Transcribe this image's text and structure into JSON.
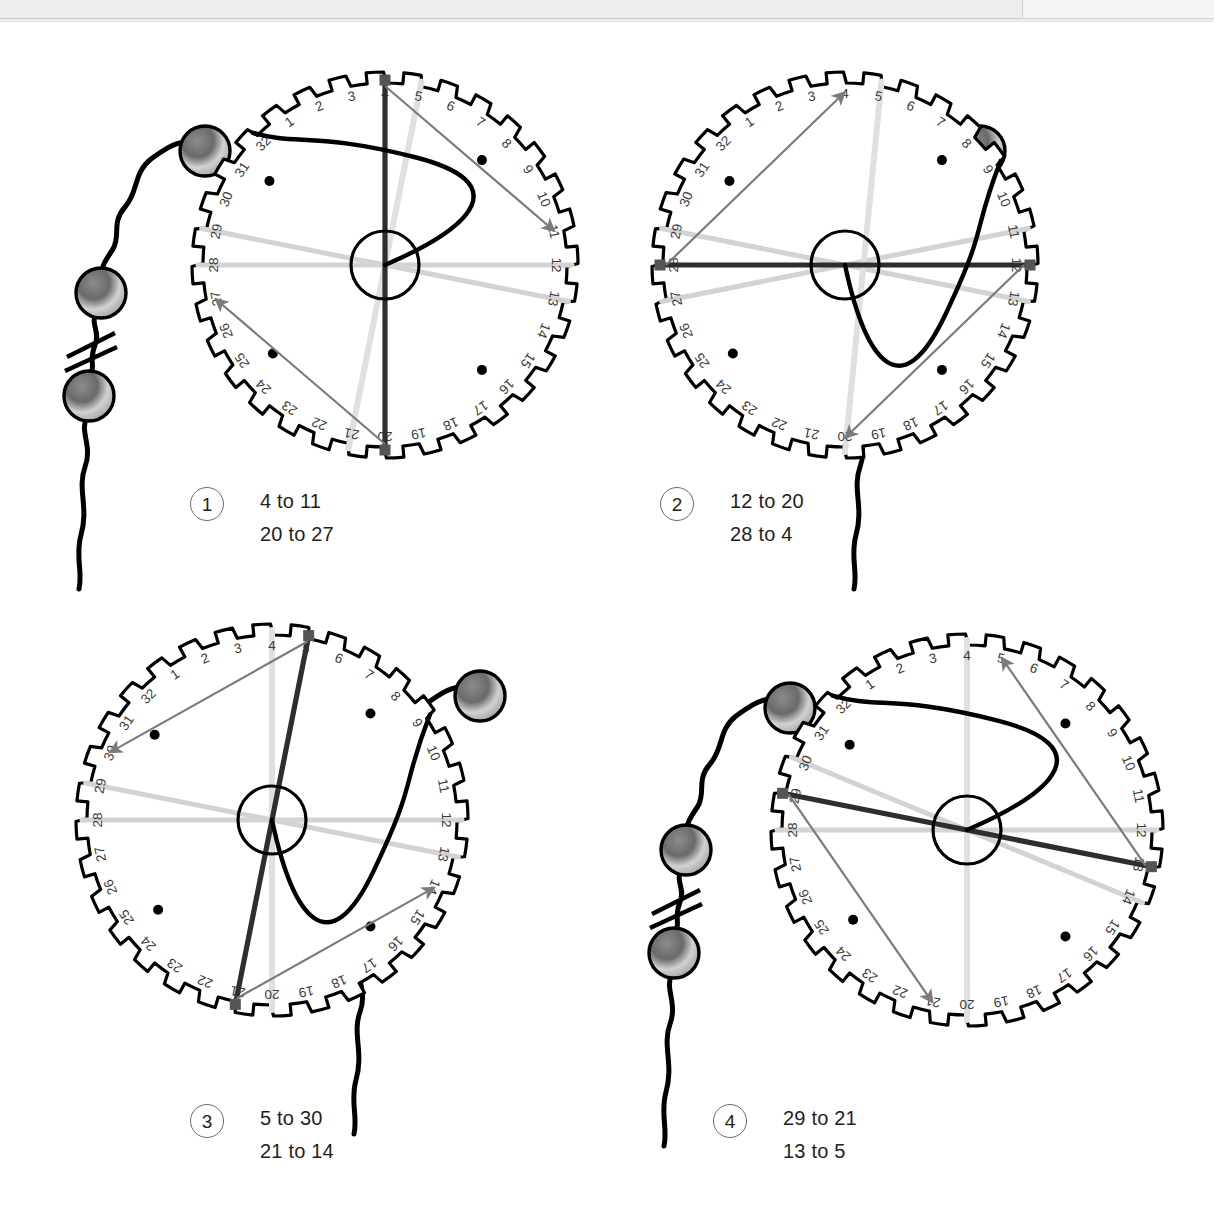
{
  "page": {
    "background": "#ffffff",
    "scan_band_color": "#ededee",
    "width": 1213,
    "height": 1221
  },
  "dial": {
    "tick_count": 32,
    "labels": [
      "1",
      "2",
      "3",
      "4",
      "5",
      "6",
      "7",
      "8",
      "9",
      "10",
      "11",
      "12",
      "13",
      "14",
      "15",
      "16",
      "17",
      "18",
      "19",
      "20",
      "21",
      "22",
      "23",
      "24",
      "25",
      "26",
      "27",
      "28",
      "29",
      "30",
      "31",
      "32"
    ],
    "hub_label": "",
    "inner_dots": 4,
    "colors": {
      "outline": "#000000",
      "label": "#3a3a3a",
      "dark_cord": "#2e2e2e",
      "arrow_gray": "#7b7b7b",
      "faint_gray": "#d3d3d3",
      "mid_gray": "#bdbdbd",
      "bead_dark": "#4a4a4a",
      "bead_light": "#c8c8c8",
      "marker": "#555555"
    }
  },
  "figures": [
    {
      "id": "figure-1",
      "number": "1",
      "lines": [
        "4 to 11",
        "20 to 27"
      ],
      "chain_side": "left",
      "cord_entry": 32,
      "cord_exit": 12,
      "dark_chord": {
        "from": 4,
        "to": 20
      },
      "pale_chord": {
        "from": 5,
        "to": 21
      },
      "arrows": [
        {
          "from": 4,
          "to": 11
        },
        {
          "from": 20,
          "to": 27
        }
      ],
      "faint_chords": [
        {
          "from": 29,
          "to": 13
        },
        {
          "from": 28,
          "to": 12
        }
      ]
    },
    {
      "id": "figure-2",
      "number": "2",
      "lines": [
        "12 to 20",
        "28 to 4"
      ],
      "chain_side": "right",
      "cord_entry": 9,
      "cord_exit": 20,
      "dark_chord": {
        "from": 12,
        "to": 28
      },
      "pale_chord": {
        "from": 5,
        "to": 20
      },
      "arrows": [
        {
          "from": 28,
          "to": 4
        },
        {
          "from": 12,
          "to": 20
        }
      ],
      "faint_chords": [
        {
          "from": 29,
          "to": 13
        },
        {
          "from": 27,
          "to": 11
        }
      ]
    },
    {
      "id": "figure-3",
      "number": "3",
      "lines": [
        "5 to 30",
        "21 to 14"
      ],
      "chain_side": "right",
      "cord_entry": 9,
      "cord_exit": 21,
      "dark_chord": {
        "from": 5,
        "to": 21
      },
      "pale_chord": {
        "from": 4,
        "to": 20
      },
      "arrows": [
        {
          "from": 5,
          "to": 30
        },
        {
          "from": 21,
          "to": 14
        }
      ],
      "faint_chords": [
        {
          "from": 29,
          "to": 13
        },
        {
          "from": 28,
          "to": 12
        }
      ]
    },
    {
      "id": "figure-4",
      "number": "4",
      "lines": [
        "29 to 21",
        "13 to 5"
      ],
      "chain_side": "left",
      "cord_entry": 32,
      "cord_exit": 13,
      "dark_chord": {
        "from": 29,
        "to": 13
      },
      "pale_chord": {
        "from": 4,
        "to": 20
      },
      "arrows": [
        {
          "from": 29,
          "to": 21
        },
        {
          "from": 13,
          "to": 5
        }
      ],
      "faint_chords": [
        {
          "from": 30,
          "to": 14
        },
        {
          "from": 28,
          "to": 12
        }
      ]
    }
  ],
  "layout": {
    "wheels": [
      {
        "cx": 385,
        "cy": 265,
        "r": 193
      },
      {
        "cx": 845,
        "cy": 265,
        "r": 193
      },
      {
        "cx": 272,
        "cy": 820,
        "r": 196
      },
      {
        "cx": 967,
        "cy": 830,
        "r": 196
      }
    ],
    "captions": [
      {
        "x": 190,
        "y": 487
      },
      {
        "x": 660,
        "y": 487
      },
      {
        "x": 190,
        "y": 1104
      },
      {
        "x": 713,
        "y": 1104
      }
    ],
    "chains": [
      {
        "x": 55,
        "y": 115,
        "flip": false
      },
      {
        "x": 1020,
        "y": 115,
        "flip": true
      },
      {
        "x": 520,
        "y": 660,
        "flip": true
      },
      {
        "x": 640,
        "y": 672,
        "flip": false
      }
    ]
  },
  "bead_chain": {
    "bead_count": 3,
    "break_mark": "double-slash",
    "bead_radius": 25
  }
}
